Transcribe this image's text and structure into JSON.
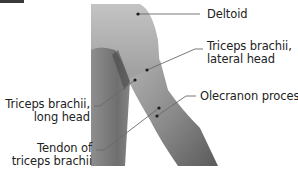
{
  "figure": {
    "colors": {
      "leader_line": "#6a6a6a",
      "dot": "#1a1a1a",
      "text": "#222222",
      "corner_tab": "#3a3a3a"
    }
  },
  "labels": [
    {
      "id": "deltoid",
      "line1": "Deltoid",
      "line2": ""
    },
    {
      "id": "triceps-lateral",
      "line1": "Triceps brachii,",
      "line2": "lateral head"
    },
    {
      "id": "triceps-long",
      "line1": "Triceps brachii,",
      "line2": "long head"
    },
    {
      "id": "olecranon",
      "line1": "Olecranon process",
      "line2": ""
    },
    {
      "id": "tendon",
      "line1": "Tendon of",
      "line2": "triceps brachii"
    }
  ]
}
